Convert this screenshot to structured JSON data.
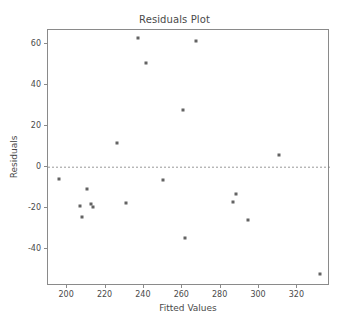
{
  "chart_data": {
    "type": "scatter",
    "title": "Residuals Plot",
    "xlabel": "Fitted Values",
    "ylabel": "Residuals",
    "xlim": [
      190,
      337
    ],
    "ylim": [
      -58,
      67
    ],
    "xticks": [
      200,
      220,
      240,
      260,
      280,
      300,
      320
    ],
    "xtick_labels": [
      "200",
      "220",
      "240",
      "260",
      "280",
      "300",
      "320"
    ],
    "yticks": [
      -40,
      -20,
      0,
      20,
      40,
      60
    ],
    "ytick_labels": [
      "-40",
      "-20",
      "0",
      "20",
      "40",
      "60"
    ],
    "grid": false,
    "legend": null,
    "reference_line": {
      "orientation": "horizontal",
      "y": 0,
      "style": "dashed",
      "color": "#7f7f7f"
    },
    "marker": {
      "shape": "square",
      "size_px": 3,
      "color": "#636363"
    },
    "series": [
      {
        "name": "residuals",
        "points": [
          {
            "x": 195.5,
            "y": -5.6
          },
          {
            "x": 206.8,
            "y": -18.9
          },
          {
            "x": 207.5,
            "y": -24.4
          },
          {
            "x": 210.5,
            "y": -10.8
          },
          {
            "x": 212.6,
            "y": -17.9
          },
          {
            "x": 213.4,
            "y": -19.5
          },
          {
            "x": 226.1,
            "y": 11.6
          },
          {
            "x": 230.6,
            "y": -17.4
          },
          {
            "x": 237.0,
            "y": 62.9
          },
          {
            "x": 241.0,
            "y": 51.1
          },
          {
            "x": 249.9,
            "y": -6.1
          },
          {
            "x": 260.6,
            "y": 27.8
          },
          {
            "x": 261.3,
            "y": -34.6
          },
          {
            "x": 267.0,
            "y": 61.7
          },
          {
            "x": 286.6,
            "y": -16.9
          },
          {
            "x": 287.8,
            "y": -13.0
          },
          {
            "x": 294.0,
            "y": -25.7
          },
          {
            "x": 310.2,
            "y": 5.9
          },
          {
            "x": 332.0,
            "y": -52.1
          }
        ]
      }
    ]
  },
  "colors": {
    "axis": "#8a8a8a",
    "text": "#4a4a4a",
    "marker": "#636363",
    "reference_line": "#7f7f7f",
    "background": "#ffffff"
  }
}
